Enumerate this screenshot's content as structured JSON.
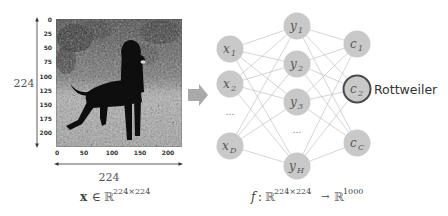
{
  "figure": {
    "image_panel": {
      "height_label": "224",
      "width_label": "224",
      "y_ticks": [
        "0",
        "25",
        "50",
        "75",
        "100",
        "125",
        "150",
        "175",
        "200"
      ],
      "x_ticks": [
        "0",
        "50",
        "100",
        "150",
        "200"
      ],
      "input_formula": {
        "var": "x",
        "in": "∈",
        "space": "ℝ",
        "dims": "224×224"
      },
      "image_description": "grayscale photo of a Rottweiler dog standing in grass"
    },
    "arrow": {
      "icon": "right-arrow-icon",
      "color": "#a9a9a9"
    },
    "network": {
      "input_layer": [
        {
          "base": "x",
          "sub": "1"
        },
        {
          "base": "x",
          "sub": "2"
        },
        {
          "base": "…",
          "sub": ""
        },
        {
          "base": "x",
          "sub": "D"
        }
      ],
      "hidden_layer": [
        {
          "base": "y",
          "sub": "1"
        },
        {
          "base": "y",
          "sub": "2"
        },
        {
          "base": "y",
          "sub": "3"
        },
        {
          "base": "…",
          "sub": ""
        },
        {
          "base": "y",
          "sub": "H"
        }
      ],
      "output_layer": [
        {
          "base": "c",
          "sub": "1"
        },
        {
          "base": "c",
          "sub": "2",
          "highlighted": true
        },
        {
          "base": "c",
          "sub": "C"
        }
      ],
      "predicted_class": "Rottweiler",
      "function_formula": {
        "f": "f",
        "colon": ":",
        "domain": "ℝ",
        "domain_dims": "224×224",
        "arrow": "→",
        "codomain": "ℝ",
        "codomain_dims": "1000"
      },
      "colors": {
        "node_fill": "#c9c9c9",
        "edge": "#b8b8b8",
        "highlight_border": "#4a4a4a"
      }
    }
  }
}
